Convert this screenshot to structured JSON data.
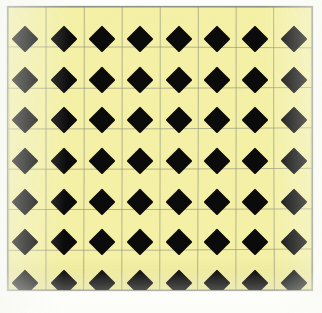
{
  "image": {
    "kind": "photograph-of-printed-pattern",
    "subject": "black-diamond-on-yellow-tiled-grid",
    "width_px": 322,
    "height_px": 313,
    "alt_text": "A photographed sheet showing a pale yellow tiled surface ruled with thin gray grid lines, with solid black diamonds centred on every tile.",
    "page_background": "#ffffff"
  },
  "plate": {
    "left_px": 7,
    "top_px": 6,
    "width_px": 306,
    "height_px": 285,
    "background_color": "#f4f1a6",
    "border_color": "#8f9287",
    "border_width_px": 1
  },
  "grid": {
    "line_color": "#8c8d7e",
    "line_width_px": 1,
    "line_opacity": 0.62,
    "columns": 8,
    "rows": 7,
    "cell_width_px": 38.2,
    "cell_height_px": 40.7,
    "vertical_line_count": 9,
    "horizontal_line_count": 8,
    "note": "Thin ruled square grid; lines meet at the left and right tips of each diamond."
  },
  "diamonds": {
    "fill_color": "#0b0b0b",
    "columns": 8,
    "rows": 7,
    "count": 56,
    "shape": "square rotated 45 degrees",
    "size_px": 27,
    "row_centers_y": [
      33,
      74,
      114,
      155,
      196,
      236,
      277
    ],
    "column_centers_x": [
      18,
      57,
      95,
      133,
      172,
      210,
      248,
      287
    ],
    "note": "One diamond centred in every grid cell; all rows are aligned in straight columns."
  },
  "colors": {
    "yellow_tile": "#f4f1a6",
    "black_diamond": "#0b0b0b",
    "grid_gray": "#8c8d7e",
    "frame_gray": "#8f9287",
    "paper_white": "#fdfdfb"
  }
}
